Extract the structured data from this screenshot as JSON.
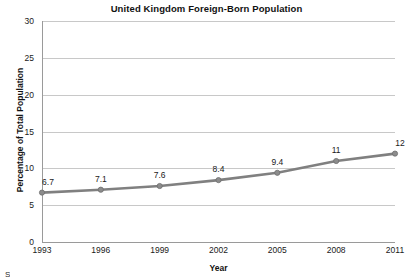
{
  "chart_data": {
    "type": "line",
    "title": "United Kingdom Foreign-Born Population",
    "xlabel": "Year",
    "ylabel": "Percentage of Total Population",
    "categories": [
      "1993",
      "1996",
      "1999",
      "2002",
      "2005",
      "2008",
      "2011"
    ],
    "x": [
      1993,
      1996,
      1999,
      2002,
      2005,
      2008,
      2011
    ],
    "values": [
      6.7,
      7.1,
      7.6,
      8.4,
      9.4,
      11,
      12
    ],
    "point_labels": [
      "6.7",
      "7.1",
      "7.6",
      "8.4",
      "9.4",
      "11",
      "12"
    ],
    "ylim": [
      0,
      30
    ],
    "xlim": [
      1993,
      2011
    ],
    "yticks": [
      0,
      5,
      10,
      15,
      20,
      25,
      30
    ],
    "ytick_labels": [
      "0",
      "5",
      "10",
      "15",
      "20",
      "25",
      "30"
    ],
    "grid": true,
    "legend": false,
    "series_color": "#808080",
    "grid_color": "#c8c8c8",
    "axis_color": "#9a9a9a",
    "text_color": "#1a1a1a"
  },
  "footer": {
    "source_stub": "S"
  }
}
